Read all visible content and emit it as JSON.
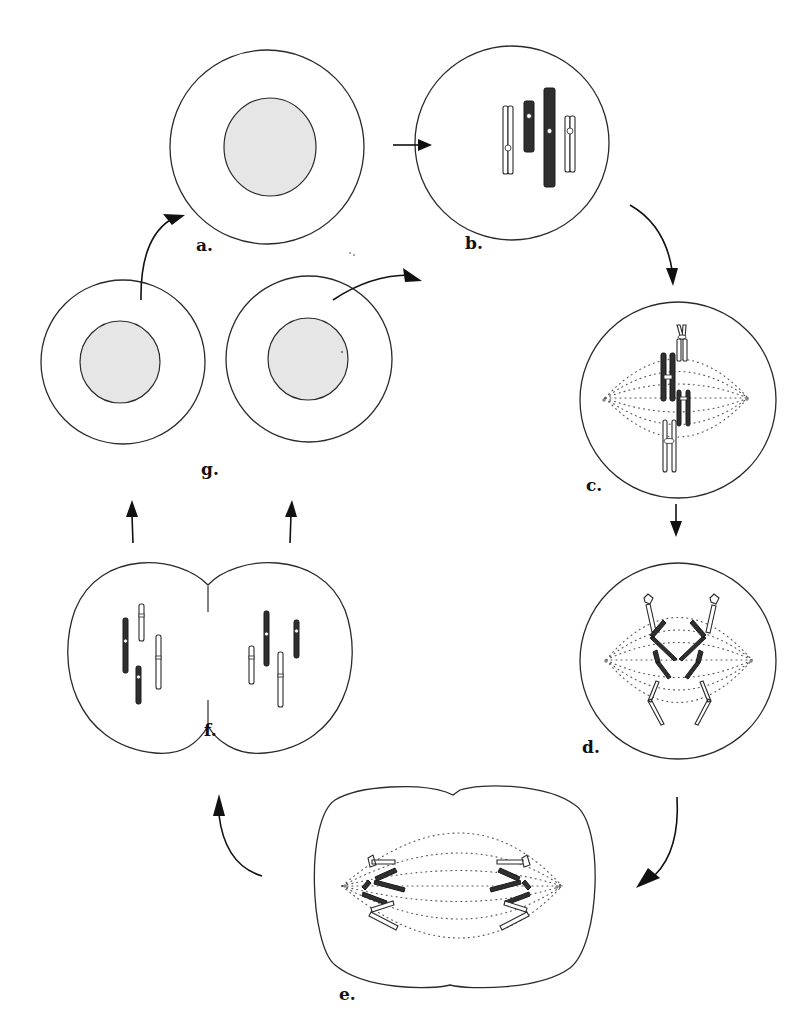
{
  "diagram": {
    "type": "cell cycle (mitosis)",
    "stages": [
      {
        "id": "a",
        "label": "a.",
        "description": "interphase cell with nucleus"
      },
      {
        "id": "b",
        "label": "b.",
        "description": "prophase - condensed chromosomes (2 dark, 2 light)"
      },
      {
        "id": "c",
        "label": "c.",
        "description": "metaphase - chromosomes aligned on spindle"
      },
      {
        "id": "d",
        "label": "d.",
        "description": "anaphase - sister chromatids separating"
      },
      {
        "id": "e",
        "label": "e.",
        "description": "telophase - chromatids at poles, cleavage furrow"
      },
      {
        "id": "f",
        "label": "f.",
        "description": "cytokinesis - two daughter cells forming"
      },
      {
        "id": "g",
        "label": "g.",
        "description": "two daughter cells in interphase"
      }
    ],
    "arrows": [
      {
        "from": "a",
        "to": "b"
      },
      {
        "from": "b",
        "to": "c"
      },
      {
        "from": "c",
        "to": "d"
      },
      {
        "from": "d",
        "to": "e"
      },
      {
        "from": "e",
        "to": "f"
      },
      {
        "from": "f",
        "to": "g",
        "count": 2
      },
      {
        "from": "g",
        "to": "a"
      },
      {
        "from": "g",
        "to": "b"
      }
    ],
    "colors": {
      "outline": "#2a2a2a",
      "nucleus_fill": "#e6e6e6",
      "dark_chromosome": "#2f2f2f",
      "light_chromosome": "#ffffff",
      "spindle": "#555555"
    }
  }
}
